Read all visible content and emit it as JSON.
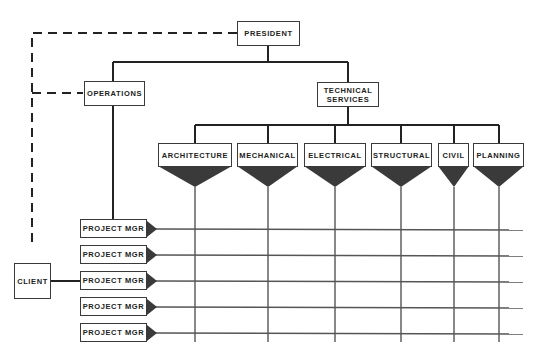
{
  "diagram": {
    "type": "matrix-organization-chart",
    "nodes": {
      "president": "PRESIDENT",
      "operations": "OPERATIONS",
      "technical_services_line1": "TECHNICAL",
      "technical_services_line2": "SERVICES",
      "client": "CLIENT"
    },
    "disciplines": [
      {
        "label": "ARCHITECTURE"
      },
      {
        "label": "MECHANICAL"
      },
      {
        "label": "ELECTRICAL"
      },
      {
        "label": "STRUCTURAL"
      },
      {
        "label": "CIVIL"
      },
      {
        "label": "PLANNING"
      }
    ],
    "project_managers": [
      {
        "label": "PROJECT MGR"
      },
      {
        "label": "PROJECT MGR"
      },
      {
        "label": "PROJECT MGR"
      },
      {
        "label": "PROJECT MGR"
      },
      {
        "label": "PROJECT MGR"
      }
    ],
    "colors": {
      "line": "#2b2b2b",
      "triangle_fill": "#3a3a3a",
      "grid": "#555555"
    }
  }
}
